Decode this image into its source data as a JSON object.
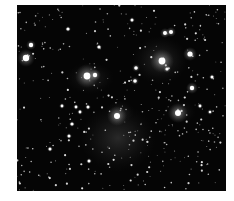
{
  "image": {
    "subject": "Star cluster with reflection nebulosity",
    "background_color": "#ffffff",
    "sky_color": "#050505",
    "frame": {
      "x": 17,
      "y": 5,
      "width": 209,
      "height": 186
    }
  },
  "bright_stars": [
    {
      "x": 26,
      "y": 58,
      "r": 3.2,
      "glow": 9
    },
    {
      "x": 31,
      "y": 45,
      "r": 2.2,
      "glow": 5
    },
    {
      "x": 87,
      "y": 76,
      "r": 3.4,
      "glow": 12
    },
    {
      "x": 95,
      "y": 75,
      "r": 2.2,
      "glow": 6
    },
    {
      "x": 162,
      "y": 61,
      "r": 3.4,
      "glow": 12
    },
    {
      "x": 190,
      "y": 54,
      "r": 2.6,
      "glow": 7
    },
    {
      "x": 165,
      "y": 33,
      "r": 2.0,
      "glow": 5
    },
    {
      "x": 171,
      "y": 32,
      "r": 2.0,
      "glow": 5
    },
    {
      "x": 192,
      "y": 88,
      "r": 2.2,
      "glow": 6
    },
    {
      "x": 117,
      "y": 116,
      "r": 3.0,
      "glow": 10
    },
    {
      "x": 178,
      "y": 113,
      "r": 3.0,
      "glow": 10
    },
    {
      "x": 136,
      "y": 68,
      "r": 1.8,
      "glow": 4
    },
    {
      "x": 167,
      "y": 69,
      "r": 1.6,
      "glow": 4
    },
    {
      "x": 132,
      "y": 20,
      "r": 1.5,
      "glow": 3
    },
    {
      "x": 68,
      "y": 29,
      "r": 1.6,
      "glow": 3
    },
    {
      "x": 99,
      "y": 47,
      "r": 1.6,
      "glow": 3
    },
    {
      "x": 135,
      "y": 81,
      "r": 1.8,
      "glow": 4
    },
    {
      "x": 212,
      "y": 77,
      "r": 1.5,
      "glow": 3
    },
    {
      "x": 72,
      "y": 124,
      "r": 1.6,
      "glow": 3
    },
    {
      "x": 69,
      "y": 136,
      "r": 1.5,
      "glow": 3
    },
    {
      "x": 50,
      "y": 149,
      "r": 1.5,
      "glow": 3
    },
    {
      "x": 89,
      "y": 161,
      "r": 1.5,
      "glow": 3
    },
    {
      "x": 88,
      "y": 107,
      "r": 1.5,
      "glow": 3
    },
    {
      "x": 76,
      "y": 107,
      "r": 1.4,
      "glow": 3
    },
    {
      "x": 80,
      "y": 112,
      "r": 1.4,
      "glow": 3
    },
    {
      "x": 62,
      "y": 106,
      "r": 1.4,
      "glow": 3
    },
    {
      "x": 200,
      "y": 106,
      "r": 1.4,
      "glow": 3
    },
    {
      "x": 210,
      "y": 112,
      "r": 1.3,
      "glow": 3
    }
  ],
  "nebulae": [
    {
      "x": 118,
      "y": 138,
      "rx": 38,
      "ry": 34,
      "alpha": 0.22
    },
    {
      "x": 160,
      "y": 60,
      "rx": 28,
      "ry": 24,
      "alpha": 0.2
    },
    {
      "x": 90,
      "y": 78,
      "rx": 24,
      "ry": 16,
      "alpha": 0.16
    },
    {
      "x": 180,
      "y": 112,
      "rx": 16,
      "ry": 12,
      "alpha": 0.12
    },
    {
      "x": 120,
      "y": 112,
      "rx": 14,
      "ry": 12,
      "alpha": 0.14
    }
  ],
  "faint_star_count": 420,
  "random_seed": 7
}
